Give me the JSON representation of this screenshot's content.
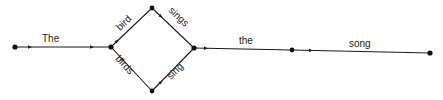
{
  "diagram": {
    "type": "word-transition-network",
    "nodes": [
      {
        "id": "n0",
        "x": 15,
        "y": 47,
        "role": "start"
      },
      {
        "id": "n1",
        "x": 111,
        "y": 47
      },
      {
        "id": "n2",
        "x": 152,
        "y": 8
      },
      {
        "id": "n3",
        "x": 152,
        "y": 91
      },
      {
        "id": "n4",
        "x": 194,
        "y": 48
      },
      {
        "id": "n5",
        "x": 292,
        "y": 50
      },
      {
        "id": "n6",
        "x": 430,
        "y": 53,
        "role": "end"
      }
    ],
    "edges": [
      {
        "from": "n0",
        "to": "n1",
        "label": "The"
      },
      {
        "from": "n1",
        "to": "n2",
        "label": "bird"
      },
      {
        "from": "n1",
        "to": "n3",
        "label": "birds"
      },
      {
        "from": "n2",
        "to": "n4",
        "label": "sings"
      },
      {
        "from": "n3",
        "to": "n4",
        "label": "sing"
      },
      {
        "from": "n4",
        "to": "n5",
        "label": "the"
      },
      {
        "from": "n5",
        "to": "n6",
        "label": "song"
      }
    ],
    "colors": {
      "ink": "#1a1a1a",
      "background": "#ffffff"
    }
  }
}
